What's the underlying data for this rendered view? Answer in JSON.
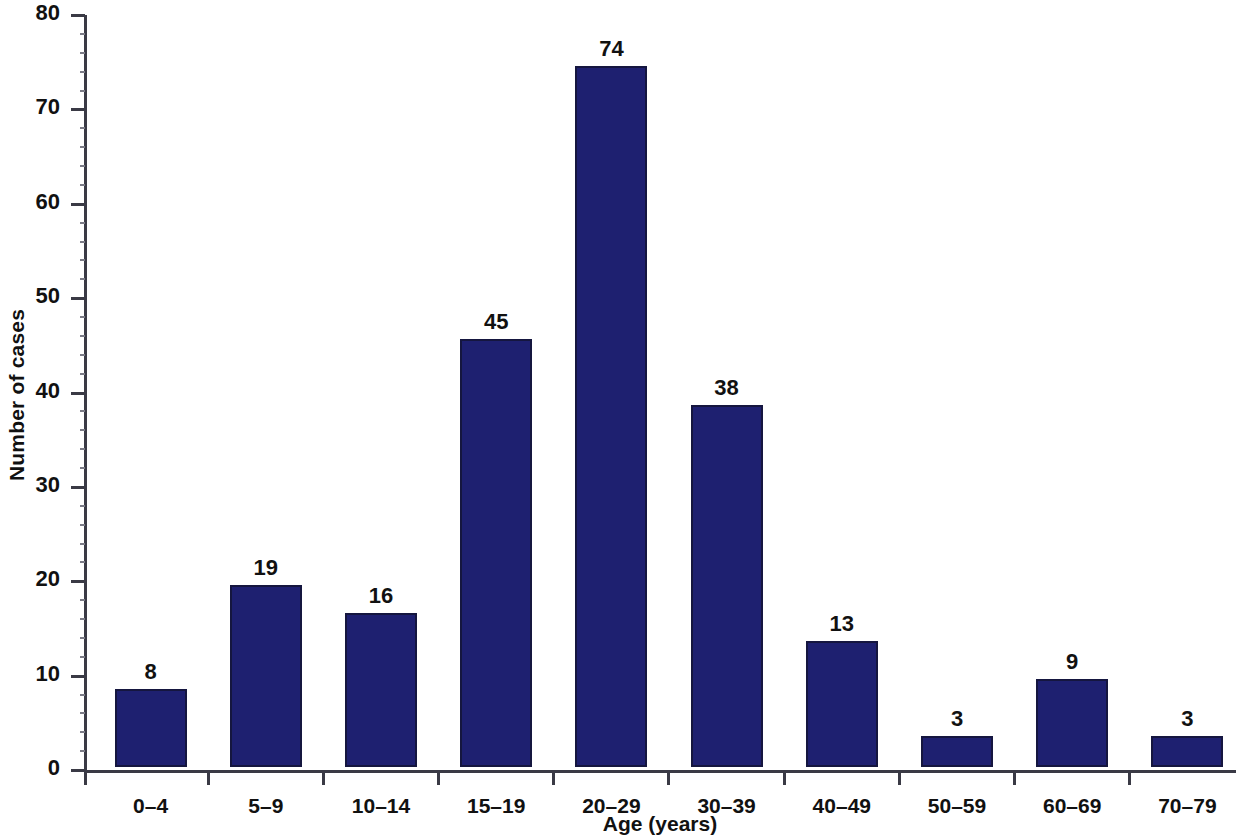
{
  "chart_data": {
    "type": "bar",
    "title": "",
    "xlabel": "Age (years)",
    "ylabel": "Number of cases",
    "categories": [
      "0–4",
      "5–9",
      "10–14",
      "15–19",
      "20–29",
      "30–39",
      "40–49",
      "50–59",
      "60–69",
      "70–79"
    ],
    "values": [
      8,
      19,
      16,
      45,
      74,
      38,
      13,
      3,
      9,
      3
    ],
    "value_labels": [
      "8",
      "19",
      "16",
      "45",
      "74",
      "38",
      "13",
      "3",
      "9",
      "3"
    ],
    "ylim": [
      0,
      80
    ],
    "ytick_values": [
      0,
      10,
      20,
      30,
      40,
      50,
      60,
      70,
      80
    ],
    "ytick_labels": [
      "0",
      "10",
      "20",
      "30",
      "40",
      "50",
      "60",
      "70",
      "80"
    ],
    "ytick_step": 10,
    "yminor_step": 2,
    "grid": false,
    "legend": false,
    "bar_color": "#1e2070",
    "bar_edge_color": "#15163f",
    "axis_color": "#3a3a45",
    "background_color": "#ffffff",
    "text_color": "#111111"
  }
}
